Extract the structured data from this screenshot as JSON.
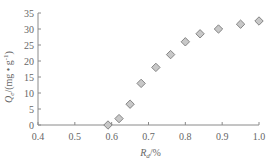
{
  "chart_data": {
    "type": "scatter",
    "title": "",
    "xlabel_main": "R",
    "xlabel_sub": "d",
    "xlabel_suffix": "/%",
    "ylabel_main": "Q",
    "ylabel_sub": "e",
    "ylabel_suffix": "/(mg • g",
    "ylabel_sup": "-1",
    "ylabel_close": ")",
    "xlim": [
      0.4,
      1.0
    ],
    "ylim": [
      0,
      35
    ],
    "xticks": [
      "0.4",
      "0.5",
      "0.6",
      "0.7",
      "0.8",
      "0.9",
      "1.0"
    ],
    "yticks": [
      "0",
      "5",
      "10",
      "15",
      "20",
      "25",
      "30",
      "35"
    ],
    "grid": false,
    "legend": null,
    "series": [
      {
        "name": "Qe",
        "marker": "diamond",
        "color": "#c8c8c8",
        "edge_color": "#7a7a7a",
        "x": [
          0.59,
          0.62,
          0.65,
          0.68,
          0.72,
          0.76,
          0.8,
          0.84,
          0.89,
          0.95,
          1.0
        ],
        "y": [
          0,
          2,
          6.5,
          13,
          18,
          22,
          26,
          28.5,
          30,
          31.5,
          32.5
        ]
      }
    ]
  }
}
